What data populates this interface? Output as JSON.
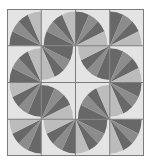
{
  "title": "",
  "quilt": {
    "rows": 4,
    "cols": 4,
    "colors": {
      "background": "#e4e4e4",
      "grid_line": "#7c7c7c",
      "wedge_light": "#bcbcbc",
      "wedge_mid": "#8c8c8c",
      "wedge_dark": "#686868"
    },
    "cells": [
      [
        "BR",
        "BR",
        "BL",
        "BL"
      ],
      [
        "BR",
        "TL",
        "TR",
        "BL"
      ],
      [
        "TR",
        "BL",
        "BR",
        "TL"
      ],
      [
        "TR",
        "TR",
        "TL",
        "TL"
      ]
    ]
  }
}
